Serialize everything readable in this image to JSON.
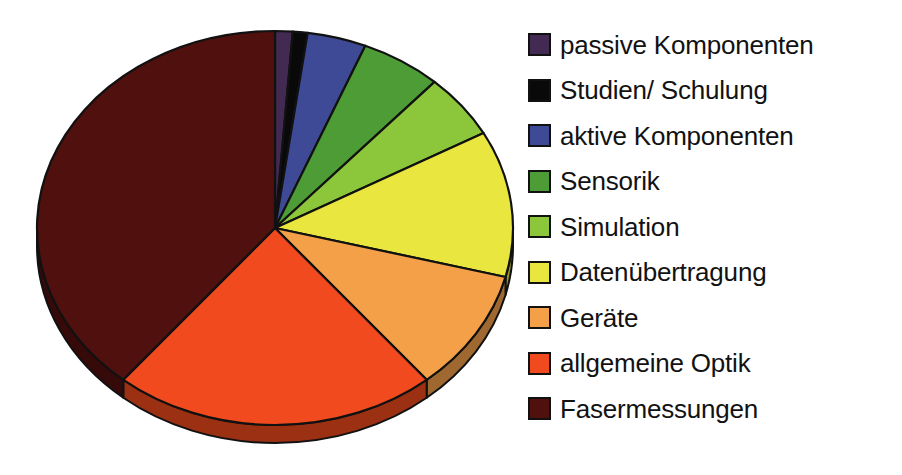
{
  "chart_data": {
    "type": "pie",
    "title": "",
    "subtitle": "",
    "xlabel": "",
    "ylabel": "",
    "grid": false,
    "legend_position": "right",
    "three_d": true,
    "rotation_start_deg": 0,
    "direction": "clockwise",
    "categories": [
      "passive Komponenten",
      "Studien/ Schulung",
      "aktive Komponenten",
      "Sensorik",
      "Simulation",
      "Datenübertragung",
      "Geräte",
      "allgemeine Optik",
      "Fasermessungen"
    ],
    "values": [
      1.2,
      1.0,
      4.0,
      5.5,
      5.3,
      12.0,
      10.0,
      22.0,
      39.0
    ],
    "units": "%",
    "colors": [
      "#432a52",
      "#090909",
      "#3f4a96",
      "#4d9c36",
      "#8cc63a",
      "#e9e63f",
      "#f3a049",
      "#f04a1e",
      "#4f100e"
    ],
    "side_colors": [
      "#2b1a36",
      "#050505",
      "#29305f",
      "#336522",
      "#5c8126",
      "#999629",
      "#9e6830",
      "#9c3013",
      "#360a09"
    ],
    "slice_boundaries_deg": [
      0,
      4.3,
      7.9,
      22.3,
      42.1,
      61.2,
      104.4,
      140.4,
      219.6,
      360
    ]
  },
  "legend": {
    "items": [
      {
        "label": "passive Komponenten",
        "color": "#432a52",
        "name": "passive-komponenten"
      },
      {
        "label": "Studien/ Schulung",
        "color": "#090909",
        "name": "studien-schulung"
      },
      {
        "label": "aktive Komponenten",
        "color": "#3f4a96",
        "name": "aktive-komponenten"
      },
      {
        "label": "Sensorik",
        "color": "#4d9c36",
        "name": "sensorik"
      },
      {
        "label": "Simulation",
        "color": "#8cc63a",
        "name": "simulation"
      },
      {
        "label": "Datenübertragung",
        "color": "#e9e63f",
        "name": "datenuebertragung"
      },
      {
        "label": "Geräte",
        "color": "#f3a049",
        "name": "geraete"
      },
      {
        "label": "allgemeine Optik",
        "color": "#f04a1e",
        "name": "allgemeine-optik"
      },
      {
        "label": "Fasermessungen",
        "color": "#4f100e",
        "name": "fasermessungen"
      }
    ]
  },
  "geometry": {
    "center_x": 275,
    "center_y": 228,
    "radius_x": 238,
    "radius_y": 197,
    "depth": 18
  },
  "colors": {
    "background": "#ffffff",
    "outline": "#111111",
    "text": "#121212"
  }
}
